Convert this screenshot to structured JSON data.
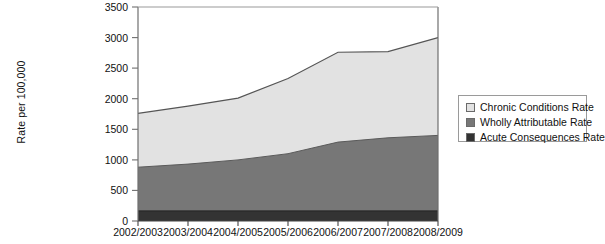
{
  "chart_data": {
    "type": "area",
    "stacked": true,
    "title": "",
    "xlabel": "",
    "ylabel": "Rate per 100,000",
    "categories": [
      "2002/2003",
      "2003/2004",
      "2004/2005",
      "2005/2006",
      "2006/2007",
      "2007/2008",
      "2008/2009"
    ],
    "ylim": [
      0,
      3500
    ],
    "y_ticks": [
      0,
      500,
      1000,
      1500,
      2000,
      2500,
      3000,
      3500
    ],
    "y_tick_labels": [
      "0",
      "500",
      "1000",
      "1500",
      "2000",
      "2500",
      "3000",
      "3500"
    ],
    "grid": false,
    "legend_position": "right",
    "series": [
      {
        "name": "Acute Consequences Rate",
        "color": "#333333",
        "values": [
          165,
          165,
          165,
          165,
          165,
          165,
          165
        ]
      },
      {
        "name": "Wholly Attributable Rate",
        "color": "#777777",
        "values": [
          715,
          765,
          835,
          935,
          1125,
          1195,
          1235
        ]
      },
      {
        "name": "Chronic Conditions Rate",
        "color": "#e2e2e2",
        "values": [
          880,
          950,
          1010,
          1230,
          1470,
          1410,
          1600
        ]
      }
    ],
    "cumulative_totals": {
      "acute_consequences": [
        165,
        165,
        165,
        165,
        165,
        165,
        165
      ],
      "acute_plus_wholly": [
        880,
        930,
        1000,
        1100,
        1290,
        1360,
        1400
      ],
      "total": [
        1760,
        1880,
        2010,
        2330,
        2760,
        2770,
        3000
      ]
    }
  },
  "axes": {
    "y_title": "Rate per 100,000",
    "y_tick_labels": [
      "3500",
      "3000",
      "2500",
      "2000",
      "1500",
      "1000",
      "500",
      "0"
    ],
    "x_tick_labels": [
      "2002/2003",
      "2003/2004",
      "2004/2005",
      "2005/2006",
      "2006/2007",
      "2007/2008",
      "2008/2009"
    ]
  },
  "legend": {
    "entries": [
      {
        "label": "Chronic Conditions Rate",
        "color": "#e2e2e2"
      },
      {
        "label": "Wholly Attributable Rate",
        "color": "#777777"
      },
      {
        "label": "Acute Consequences Rate",
        "color": "#333333"
      }
    ]
  },
  "colors": {
    "chronic": "#e2e2e2",
    "wholly": "#777777",
    "acute": "#333333",
    "axis": "#6f6f6f",
    "outline": "#4a4a4a"
  }
}
